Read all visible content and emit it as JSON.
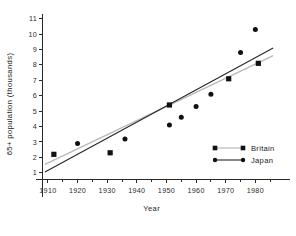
{
  "chart_data": {
    "type": "scatter",
    "title": "",
    "xlabel": "Year",
    "ylabel": "65+ population (thousands)",
    "xlim": [
      1908,
      1990
    ],
    "ylim": [
      0.6,
      11.3
    ],
    "xticks": [
      1910,
      1920,
      1930,
      1940,
      1950,
      1960,
      1970,
      1980
    ],
    "xtick_labels": [
      "1910",
      "1920",
      "1930",
      "1940",
      "1950",
      "1960",
      "1970",
      "1980"
    ],
    "yticks": [
      1,
      2,
      3,
      4,
      5,
      6,
      7,
      8,
      9,
      10,
      11
    ],
    "ytick_labels": [
      "1",
      "2",
      "3",
      "4",
      "5",
      "6",
      "7",
      "8",
      "9",
      "10",
      "11"
    ],
    "grid": false,
    "legend_position": "lower right",
    "series": [
      {
        "name": "Britain",
        "marker": "square",
        "line_style": "dotted",
        "color": "#111111",
        "line_color": "#b9b9b9",
        "points": [
          {
            "x": 1912,
            "y": 2.2
          },
          {
            "x": 1931,
            "y": 2.3
          },
          {
            "x": 1951,
            "y": 5.4
          },
          {
            "x": 1971,
            "y": 7.1
          },
          {
            "x": 1981,
            "y": 8.1
          }
        ],
        "fit_line": {
          "x1": 1909,
          "y1": 1.55,
          "x2": 1986,
          "y2": 8.6
        }
      },
      {
        "name": "Japan",
        "marker": "circle",
        "line_style": "solid",
        "color": "#111111",
        "line_color": "#262626",
        "points": [
          {
            "x": 1920,
            "y": 2.9
          },
          {
            "x": 1936,
            "y": 3.2
          },
          {
            "x": 1951,
            "y": 4.1
          },
          {
            "x": 1955,
            "y": 4.6
          },
          {
            "x": 1960,
            "y": 5.3
          },
          {
            "x": 1965,
            "y": 6.1
          },
          {
            "x": 1975,
            "y": 8.8
          },
          {
            "x": 1980,
            "y": 10.3
          }
        ],
        "fit_line": {
          "x1": 1909,
          "y1": 1.05,
          "x2": 1986,
          "y2": 9.1
        }
      }
    ]
  },
  "legend": {
    "entries": [
      {
        "label": "Britain",
        "marker": "square"
      },
      {
        "label": "Japan",
        "marker": "circle"
      }
    ]
  }
}
